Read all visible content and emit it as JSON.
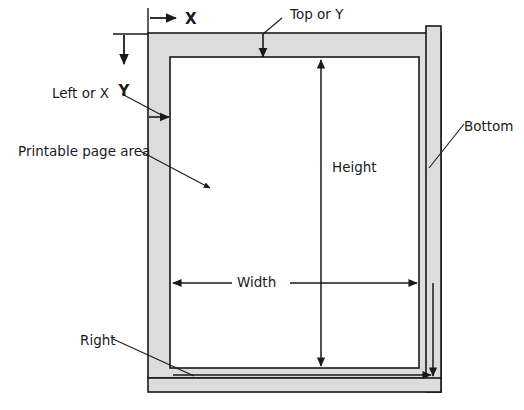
{
  "diagram": {
    "type": "page-margin-schematic",
    "colors": {
      "margin_fill": "#dcdcdc",
      "page_fill": "#ffffff",
      "stroke": "#1a1a1a",
      "text": "#1a1a1a",
      "background": "#ffffff"
    },
    "labels": {
      "axis_x": "X",
      "axis_y": "Y",
      "left_or_x": "Left or X",
      "top_or_y": "Top or Y",
      "printable_page_area": "Printable page area",
      "bottom": "Bottom",
      "right": "Right",
      "height": "Height",
      "width": "Width"
    },
    "callouts": [
      {
        "name": "axis-x",
        "label": "X",
        "kind": "axis-arrow",
        "direction": "right"
      },
      {
        "name": "axis-y",
        "label": "Y",
        "kind": "axis-arrow",
        "direction": "down"
      },
      {
        "name": "left-or-x",
        "label": "Left or X",
        "kind": "leader-arrow"
      },
      {
        "name": "top-or-y",
        "label": "Top or Y",
        "kind": "leader-arrow"
      },
      {
        "name": "printable-page-area",
        "label": "Printable page area",
        "kind": "leader-arrow"
      },
      {
        "name": "bottom",
        "label": "Bottom",
        "kind": "leader-line"
      },
      {
        "name": "right",
        "label": "Right",
        "kind": "leader-line"
      },
      {
        "name": "height",
        "label": "Height",
        "kind": "dimension-double-arrow",
        "orientation": "vertical"
      },
      {
        "name": "width",
        "label": "Width",
        "kind": "dimension-double-arrow",
        "orientation": "horizontal"
      }
    ]
  }
}
